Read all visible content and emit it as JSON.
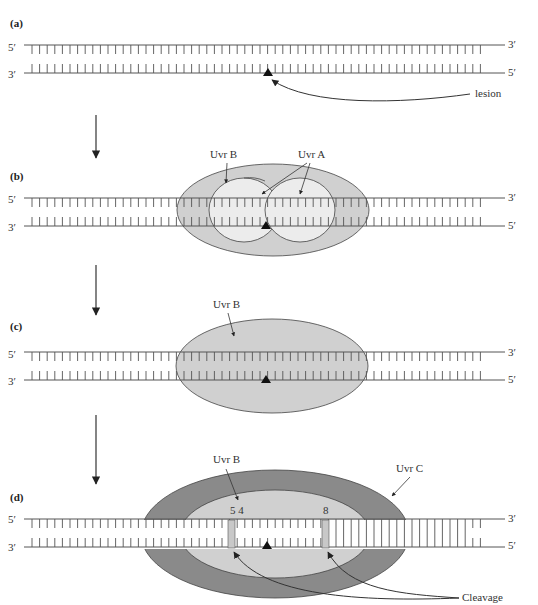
{
  "diagram": {
    "colors": {
      "strand": "#555555",
      "uvrB_fill": "#d0d0d0",
      "uvrA_fill": "#ececec",
      "uvrC_fill": "#8a8a8a",
      "lesion": "#111111",
      "arrow": "#333333"
    },
    "panels": [
      {
        "id": "a",
        "label": "(a)",
        "top_left": "5′",
        "top_right": "3′",
        "bottom_left": "3′",
        "bottom_right": "5′",
        "callouts": [
          {
            "text": "lesion"
          }
        ]
      },
      {
        "id": "b",
        "label": "(b)",
        "top_left": "5′",
        "top_right": "3′",
        "bottom_left": "3′",
        "bottom_right": "5′",
        "callouts": [
          {
            "text": "Uvr B"
          },
          {
            "text": "Uvr A"
          }
        ]
      },
      {
        "id": "c",
        "label": "(c)",
        "top_left": "5′",
        "top_right": "3′",
        "bottom_left": "3′",
        "bottom_right": "5′",
        "callouts": [
          {
            "text": "Uvr B"
          }
        ]
      },
      {
        "id": "d",
        "label": "(d)",
        "top_left": "5′",
        "top_right": "3′",
        "bottom_left": "3′",
        "bottom_right": "5′",
        "callouts": [
          {
            "text": "Uvr B"
          },
          {
            "text": "Uvr C"
          },
          {
            "text": "Cleavage"
          }
        ],
        "cut_site_labels": [
          "5 4",
          "8"
        ]
      }
    ]
  }
}
